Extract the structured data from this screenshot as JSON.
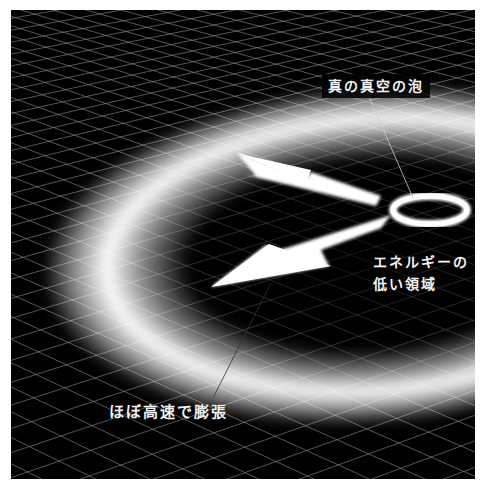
{
  "diagram": {
    "colors": {
      "background": "#000000",
      "grid": "#9a9a9a",
      "glow": "#ffffff",
      "text": "#f2f2f2",
      "page": "#ffffff"
    },
    "labels": {
      "bubble": "真の真空の泡",
      "low_energy_line1": "エネルギーの",
      "low_energy_line2": "低い領域",
      "expansion": "ほぼ高速で膨張"
    },
    "elements": [
      {
        "name": "perspective-grid",
        "icon": "grid"
      },
      {
        "name": "expanding-glow-ring",
        "icon": "ring"
      },
      {
        "name": "small-bubble-ring",
        "icon": "ring"
      },
      {
        "name": "arrow-upper-left",
        "icon": "arrow"
      },
      {
        "name": "arrow-lower-left",
        "icon": "arrow"
      }
    ]
  }
}
